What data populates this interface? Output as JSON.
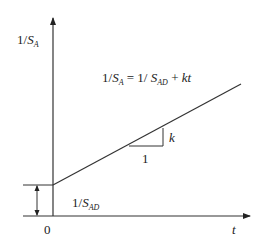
{
  "diagram": {
    "type": "linear-graph",
    "y_axis_label": {
      "prefix": "1/",
      "var": "S",
      "sub": "A"
    },
    "x_axis_label": "t",
    "origin_label": "0",
    "equation": {
      "lhs_prefix": "1/",
      "lhs_var": "S",
      "lhs_sub": "A",
      "equals": " = ",
      "rhs_prefix": "1/ ",
      "rhs_var": "S",
      "rhs_sub": "AD",
      "plus": " + ",
      "term": "kt"
    },
    "intercept_label": {
      "prefix": "1/",
      "var": "S",
      "sub": "AD"
    },
    "slope_run_label": "1",
    "slope_rise_label": "k",
    "colors": {
      "line": "#333333",
      "background": "#ffffff"
    }
  }
}
